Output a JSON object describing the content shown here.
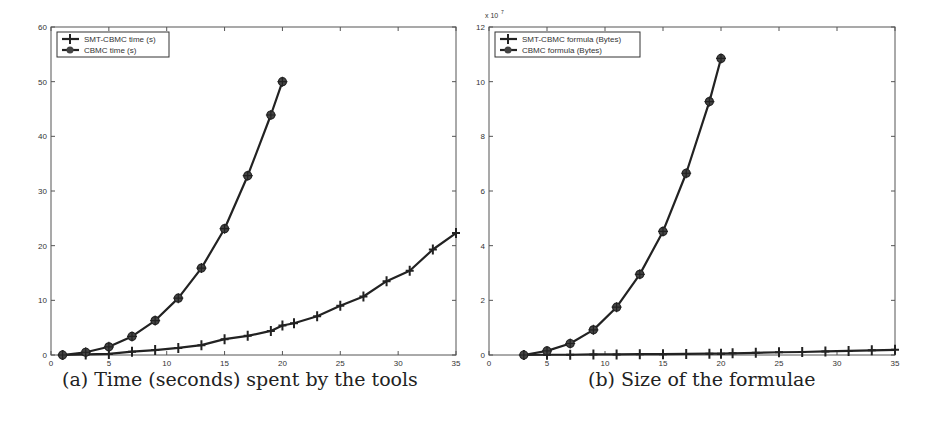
{
  "chart_data": [
    {
      "type": "line",
      "caption": "(a) Time (seconds) spent by the tools",
      "title": "",
      "xlabel": "",
      "ylabel": "",
      "xlim": [
        0,
        35
      ],
      "ylim": [
        0,
        60
      ],
      "xticks": [
        0,
        5,
        10,
        15,
        20,
        25,
        30,
        35
      ],
      "yticks": [
        0,
        10,
        20,
        30,
        40,
        50,
        60
      ],
      "y_multiplier": "",
      "grid": false,
      "legend_position": "upper-left",
      "series": [
        {
          "name": "SMT-CBMC time (s)",
          "marker": "plus",
          "x": [
            1,
            3,
            5,
            7,
            9,
            11,
            13,
            15,
            17,
            19,
            20,
            21,
            23,
            25,
            27,
            29,
            31,
            33,
            35
          ],
          "values": [
            0,
            0.1,
            0.2,
            0.6,
            0.9,
            1.3,
            1.8,
            2.9,
            3.5,
            4.4,
            5.4,
            5.8,
            7.1,
            9.0,
            10.7,
            13.5,
            15.4,
            19.3,
            22.3
          ]
        },
        {
          "name": "CBMC time (s)",
          "marker": "star",
          "x": [
            1,
            3,
            5,
            7,
            9,
            11,
            13,
            15,
            17,
            19,
            20
          ],
          "values": [
            0,
            0.5,
            1.5,
            3.4,
            6.3,
            10.4,
            15.9,
            23.1,
            32.8,
            43.9,
            50
          ]
        }
      ]
    },
    {
      "type": "line",
      "caption": "(b) Size of the formulae",
      "title": "",
      "xlabel": "",
      "ylabel": "",
      "xlim": [
        0,
        35
      ],
      "ylim": [
        0,
        12
      ],
      "xticks": [
        0,
        5,
        10,
        15,
        20,
        25,
        30,
        35
      ],
      "yticks": [
        0,
        2,
        4,
        6,
        8,
        10,
        12
      ],
      "y_multiplier": "x 10^7",
      "grid": false,
      "legend_position": "upper-left",
      "series": [
        {
          "name": "SMT-CBMC formula (Bytes)",
          "marker": "plus",
          "x": [
            3,
            5,
            7,
            9,
            11,
            13,
            15,
            17,
            19,
            20,
            21,
            23,
            25,
            27,
            29,
            31,
            33,
            35
          ],
          "values": [
            0,
            0.01,
            0.01,
            0.02,
            0.02,
            0.03,
            0.03,
            0.04,
            0.05,
            0.05,
            0.06,
            0.08,
            0.1,
            0.11,
            0.13,
            0.15,
            0.17,
            0.19
          ]
        },
        {
          "name": "CBMC formula (Bytes)",
          "marker": "star",
          "x": [
            3,
            5,
            7,
            9,
            11,
            13,
            15,
            17,
            19,
            20
          ],
          "values": [
            0,
            0.15,
            0.42,
            0.92,
            1.75,
            2.95,
            4.52,
            6.65,
            9.27,
            10.85
          ]
        }
      ]
    }
  ]
}
